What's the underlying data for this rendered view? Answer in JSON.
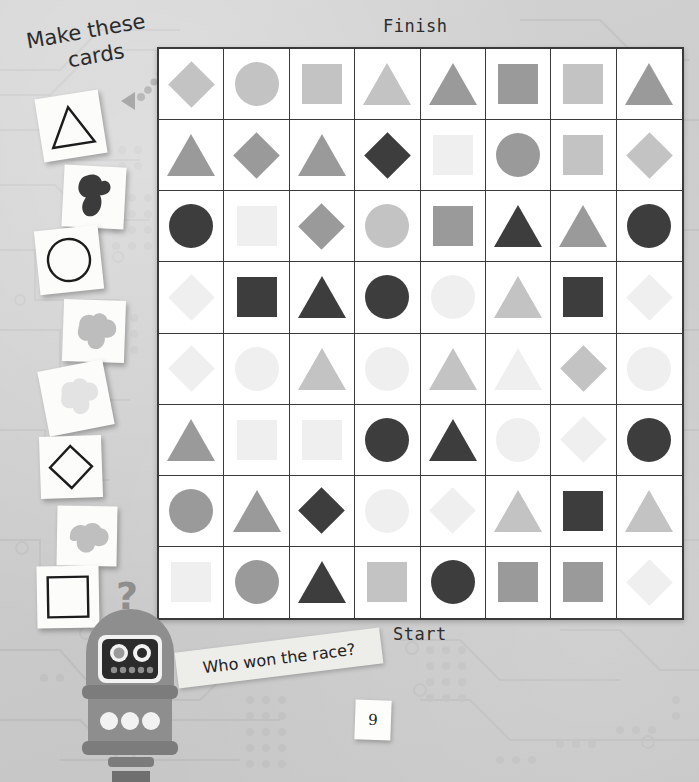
{
  "page": {
    "title": "Make these cards",
    "page_number": "9",
    "background_color": "#cdcdcd"
  },
  "headline": {
    "line1": "Make these",
    "line2": "cards"
  },
  "board": {
    "finish_label": "Finish",
    "start_label": "Start",
    "border_color": "#3a3a3a",
    "cell_background": "#ffffff",
    "rows": 8,
    "cols": 8,
    "palette": {
      "dark": "#3d3d3d",
      "medium": "#9a9a9a",
      "light": "#c3c3c3",
      "verylight": "#efefef"
    },
    "cells": [
      [
        {
          "shape": "diamond",
          "tone": "light"
        },
        {
          "shape": "circle",
          "tone": "light"
        },
        {
          "shape": "square",
          "tone": "light"
        },
        {
          "shape": "triangle",
          "tone": "light"
        },
        {
          "shape": "triangle",
          "tone": "medium"
        },
        {
          "shape": "square",
          "tone": "medium"
        },
        {
          "shape": "square",
          "tone": "light"
        },
        {
          "shape": "triangle",
          "tone": "medium"
        }
      ],
      [
        {
          "shape": "triangle",
          "tone": "medium"
        },
        {
          "shape": "diamond",
          "tone": "medium"
        },
        {
          "shape": "triangle",
          "tone": "medium"
        },
        {
          "shape": "diamond",
          "tone": "dark"
        },
        {
          "shape": "square",
          "tone": "verylight"
        },
        {
          "shape": "circle",
          "tone": "medium"
        },
        {
          "shape": "square",
          "tone": "light"
        },
        {
          "shape": "diamond",
          "tone": "light"
        }
      ],
      [
        {
          "shape": "circle",
          "tone": "dark"
        },
        {
          "shape": "square",
          "tone": "verylight"
        },
        {
          "shape": "diamond",
          "tone": "medium"
        },
        {
          "shape": "circle",
          "tone": "light"
        },
        {
          "shape": "square",
          "tone": "medium"
        },
        {
          "shape": "triangle",
          "tone": "dark"
        },
        {
          "shape": "triangle",
          "tone": "medium"
        },
        {
          "shape": "circle",
          "tone": "dark"
        }
      ],
      [
        {
          "shape": "diamond",
          "tone": "verylight"
        },
        {
          "shape": "square",
          "tone": "dark"
        },
        {
          "shape": "triangle",
          "tone": "dark"
        },
        {
          "shape": "circle",
          "tone": "dark"
        },
        {
          "shape": "circle",
          "tone": "verylight"
        },
        {
          "shape": "triangle",
          "tone": "light"
        },
        {
          "shape": "square",
          "tone": "dark"
        },
        {
          "shape": "diamond",
          "tone": "verylight"
        }
      ],
      [
        {
          "shape": "diamond",
          "tone": "verylight"
        },
        {
          "shape": "circle",
          "tone": "verylight"
        },
        {
          "shape": "triangle",
          "tone": "light"
        },
        {
          "shape": "circle",
          "tone": "verylight"
        },
        {
          "shape": "triangle",
          "tone": "light"
        },
        {
          "shape": "triangle",
          "tone": "verylight"
        },
        {
          "shape": "diamond",
          "tone": "light"
        },
        {
          "shape": "circle",
          "tone": "verylight"
        }
      ],
      [
        {
          "shape": "triangle",
          "tone": "medium"
        },
        {
          "shape": "square",
          "tone": "verylight"
        },
        {
          "shape": "square",
          "tone": "verylight"
        },
        {
          "shape": "circle",
          "tone": "dark"
        },
        {
          "shape": "triangle",
          "tone": "dark"
        },
        {
          "shape": "circle",
          "tone": "verylight"
        },
        {
          "shape": "diamond",
          "tone": "verylight"
        },
        {
          "shape": "circle",
          "tone": "dark"
        }
      ],
      [
        {
          "shape": "circle",
          "tone": "medium"
        },
        {
          "shape": "triangle",
          "tone": "medium"
        },
        {
          "shape": "diamond",
          "tone": "dark"
        },
        {
          "shape": "circle",
          "tone": "verylight"
        },
        {
          "shape": "diamond",
          "tone": "verylight"
        },
        {
          "shape": "triangle",
          "tone": "light"
        },
        {
          "shape": "square",
          "tone": "dark"
        },
        {
          "shape": "triangle",
          "tone": "light"
        }
      ],
      [
        {
          "shape": "square",
          "tone": "verylight"
        },
        {
          "shape": "circle",
          "tone": "medium"
        },
        {
          "shape": "triangle",
          "tone": "dark"
        },
        {
          "shape": "square",
          "tone": "light"
        },
        {
          "shape": "circle",
          "tone": "dark"
        },
        {
          "shape": "square",
          "tone": "medium"
        },
        {
          "shape": "square",
          "tone": "medium"
        },
        {
          "shape": "diamond",
          "tone": "verylight"
        }
      ]
    ]
  },
  "cards": [
    {
      "name": "triangle-outline-card",
      "icon": "triangle-outline-icon",
      "style": "outline",
      "shape": "triangle"
    },
    {
      "name": "triangle-blob-card",
      "icon": "triangle-blob-dark-icon",
      "style": "blob-dark",
      "shape": "blob"
    },
    {
      "name": "circle-outline-card",
      "icon": "circle-outline-icon",
      "style": "outline",
      "shape": "circle"
    },
    {
      "name": "circle-blob-card",
      "icon": "circle-blob-grey-icon",
      "style": "blob-grey",
      "shape": "blob"
    },
    {
      "name": "blank-blob-card",
      "icon": "faint-blob-icon",
      "style": "blob-faint",
      "shape": "blob"
    },
    {
      "name": "diamond-outline-card",
      "icon": "diamond-outline-icon",
      "style": "outline",
      "shape": "diamond"
    },
    {
      "name": "diamond-blob-card",
      "icon": "diamond-blob-grey-icon",
      "style": "blob-grey",
      "shape": "blob"
    },
    {
      "name": "square-outline-card",
      "icon": "square-outline-icon",
      "style": "outline",
      "shape": "square"
    }
  ],
  "robot": {
    "question_mark": "?",
    "speech": "Who won the race?",
    "body_color": "#8e8e8e",
    "face_color": "#2b2b2b"
  }
}
